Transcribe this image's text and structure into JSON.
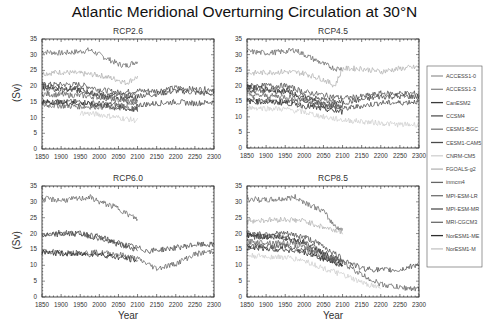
{
  "title": "Atlantic Meridional Overturning Circulation at 30°N",
  "chart_data": {
    "type": "line",
    "title": "Atlantic Meridional Overturning Circulation at 30°N",
    "xlabel": "Year",
    "ylabel": "(Sv)",
    "xlim": [
      1850,
      2300
    ],
    "ylim": [
      0,
      35
    ],
    "xticks": [
      1850,
      1900,
      1950,
      2000,
      2050,
      2100,
      2150,
      2200,
      2250,
      2300
    ],
    "yticks": [
      0,
      5,
      10,
      15,
      20,
      25,
      30,
      35
    ],
    "grid": false,
    "legend_position": "right",
    "legend": [
      "ACCESS1-0",
      "ACCESS1-3",
      "CanESM2",
      "CCSM4",
      "CESM1-BGC",
      "CESM1-CAM5",
      "CNRM-CM5",
      "FGOALS-g2",
      "inmcm4",
      "MPI-ESM-LR",
      "MPI-ESM-MR",
      "MRI-CGCM3",
      "NorESM1-ME",
      "NorESM1-M"
    ],
    "legend_colors": [
      "#9a9a9a",
      "#8a8a8a",
      "#3a3a3a",
      "#555555",
      "#7a7a7a",
      "#4a4a4a",
      "#d0d0d0",
      "#b5b5b5",
      "#666666",
      "#707070",
      "#505050",
      "#6a6a6a",
      "#2e2e2e",
      "#c4c4c4"
    ],
    "panels": [
      {
        "title": "RCP2.6",
        "series": [
          {
            "name": "MPI-ESM-LR",
            "x": [
              1850,
              1900,
              1950,
              1975,
              2000,
              2050,
              2070,
              2100
            ],
            "y": [
              31,
              30.5,
              31,
              31.5,
              30,
              27,
              26.5,
              28
            ]
          },
          {
            "name": "FGOALS-g2",
            "x": [
              1850,
              1900,
              1950,
              2000,
              2050,
              2070,
              2100
            ],
            "y": [
              24,
              24.5,
              24,
              23.5,
              22,
              21,
              23
            ]
          },
          {
            "name": "CCSM4",
            "x": [
              1850,
              1950,
              2000,
              2050,
              2100,
              2150,
              2200,
              2250,
              2300
            ],
            "y": [
              20.5,
              20.5,
              19,
              18,
              18.5,
              18.5,
              19.5,
              19,
              19
            ]
          },
          {
            "name": "CESM1-CAM5",
            "x": [
              1850,
              1950,
              2000,
              2050,
              2100,
              2150,
              2200,
              2250,
              2300
            ],
            "y": [
              19,
              18.5,
              17.5,
              17,
              17,
              17.5,
              18.5,
              18,
              17.5
            ]
          },
          {
            "name": "CanESM2",
            "x": [
              1850,
              1950,
              2000,
              2050,
              2100
            ],
            "y": [
              20,
              19,
              17,
              16,
              16
            ]
          },
          {
            "name": "MRI-CGCM3",
            "x": [
              1850,
              1950,
              2000,
              2050,
              2100
            ],
            "y": [
              17.5,
              17,
              16.5,
              15.5,
              15
            ]
          },
          {
            "name": "MPI-ESM-MR",
            "x": [
              1850,
              1950,
              2000,
              2050,
              2100,
              2150,
              2200,
              2250,
              2300
            ],
            "y": [
              15,
              15,
              14.5,
              14,
              14,
              14.5,
              15,
              14.5,
              15
            ]
          },
          {
            "name": "NorESM1-ME",
            "x": [
              1850,
              1950,
              2000,
              2050,
              2100
            ],
            "y": [
              15,
              14.5,
              14,
              13,
              12.5
            ]
          },
          {
            "name": "inmcm4",
            "x": [
              1850,
              1950,
              2000,
              2050,
              2100
            ],
            "y": [
              14,
              13.5,
              13.5,
              13,
              13
            ]
          },
          {
            "name": "CNRM-CM5",
            "x": [
              1950,
              2000,
              2050,
              2100
            ],
            "y": [
              11.5,
              11,
              10,
              9
            ]
          }
        ]
      },
      {
        "title": "RCP4.5",
        "series": [
          {
            "name": "MPI-ESM-LR",
            "x": [
              1850,
              1900,
              1950,
              1975,
              2000,
              2050,
              2080,
              2100
            ],
            "y": [
              31,
              30.5,
              31,
              31.5,
              30,
              27,
              25.5,
              25.5
            ]
          },
          {
            "name": "FGOALS-g2",
            "x": [
              1850,
              1950,
              2000,
              2050,
              2080,
              2100,
              2150,
              2200,
              2250,
              2300
            ],
            "y": [
              24,
              24.5,
              24,
              22,
              20,
              25.5,
              25.5,
              24.5,
              25.5,
              26
            ]
          },
          {
            "name": "CCSM4",
            "x": [
              1850,
              1950,
              2000,
              2050,
              2100,
              2150,
              2200,
              2250,
              2300
            ],
            "y": [
              20,
              20,
              18,
              17,
              16,
              16.5,
              17.5,
              17.5,
              17.5
            ]
          },
          {
            "name": "CESM1-CAM5",
            "x": [
              1850,
              1950,
              2000,
              2050,
              2100,
              2150,
              2200,
              2250,
              2300
            ],
            "y": [
              18.5,
              18,
              16.5,
              15.5,
              14.5,
              15.5,
              16.5,
              16.5,
              16.5
            ]
          },
          {
            "name": "CanESM2",
            "x": [
              1850,
              1950,
              2000,
              2050,
              2100
            ],
            "y": [
              19.5,
              18.5,
              16,
              14.5,
              13.5
            ]
          },
          {
            "name": "MRI-CGCM3",
            "x": [
              1850,
              1950,
              2000,
              2050,
              2100
            ],
            "y": [
              17,
              16.5,
              15.5,
              14,
              13
            ]
          },
          {
            "name": "MPI-ESM-MR",
            "x": [
              1850,
              1950,
              2000,
              2050,
              2100,
              2150,
              2200,
              2250,
              2300
            ],
            "y": [
              15.5,
              15,
              14.5,
              13.5,
              12.5,
              13.5,
              14.5,
              14.5,
              15
            ]
          },
          {
            "name": "NorESM1-ME",
            "x": [
              1850,
              1950,
              2000,
              2050,
              2100
            ],
            "y": [
              15,
              14.5,
              13.5,
              12.5,
              11.5
            ]
          },
          {
            "name": "CNRM-CM5",
            "x": [
              1850,
              1950,
              2000,
              2050,
              2100,
              2150,
              2200,
              2250,
              2300
            ],
            "y": [
              13,
              12.5,
              11.5,
              10,
              9,
              8.5,
              8,
              7.5,
              7.5
            ]
          }
        ]
      },
      {
        "title": "RCP6.0",
        "series": [
          {
            "name": "MPI-ESM-LR",
            "x": [
              1850,
              1900,
              1950,
              1975,
              2000,
              2050,
              2075,
              2100
            ],
            "y": [
              31,
              30.5,
              31,
              31.5,
              30,
              28,
              26,
              24.5
            ]
          },
          {
            "name": "CCSM4",
            "x": [
              1850,
              1900,
              1950,
              2000,
              2050,
              2100,
              2130,
              2200,
              2250,
              2300
            ],
            "y": [
              19.5,
              20.5,
              20,
              19,
              17,
              15.5,
              14.5,
              15.5,
              16.5,
              16.5
            ]
          },
          {
            "name": "CESM1-CAM5",
            "x": [
              1850,
              1950,
              2000,
              2050,
              2100
            ],
            "y": [
              19.5,
              20,
              18.5,
              16.5,
              15
            ]
          },
          {
            "name": "MRI-CGCM3",
            "x": [
              1850,
              1900,
              1950,
              2000,
              2050,
              2100,
              2150,
              2200,
              2250,
              2300
            ],
            "y": [
              14.5,
              14,
              14,
              14,
              13.5,
              12,
              9,
              10.5,
              13.5,
              14.5
            ]
          },
          {
            "name": "NorESM1-ME",
            "x": [
              1850,
              1950,
              2000,
              2050,
              2100
            ],
            "y": [
              14,
              13.5,
              13.5,
              12.5,
              11.5
            ]
          }
        ]
      },
      {
        "title": "RCP8.5",
        "series": [
          {
            "name": "MPI-ESM-LR",
            "x": [
              1850,
              1900,
              1950,
              1975,
              2000,
              2050,
              2075,
              2100
            ],
            "y": [
              31,
              30.5,
              31,
              31.5,
              30,
              27,
              23,
              21
            ]
          },
          {
            "name": "FGOALS-g2",
            "x": [
              1850,
              1950,
              2000,
              2050,
              2100
            ],
            "y": [
              24,
              24.5,
              24,
              22,
              20.5
            ]
          },
          {
            "name": "CCSM4",
            "x": [
              1850,
              1950,
              2000,
              2050,
              2100,
              2150,
              2200,
              2250,
              2300
            ],
            "y": [
              20,
              20,
              19,
              16,
              12,
              9,
              8.5,
              8.5,
              10.5
            ]
          },
          {
            "name": "CESM1-CAM5",
            "x": [
              1850,
              1950,
              2000,
              2050,
              2100
            ],
            "y": [
              19,
              19,
              17.5,
              14,
              11
            ]
          },
          {
            "name": "CanESM2",
            "x": [
              1850,
              1950,
              2000,
              2050,
              2100
            ],
            "y": [
              19.5,
              18.5,
              17,
              13.5,
              10.5
            ]
          },
          {
            "name": "MRI-CGCM3",
            "x": [
              1850,
              1950,
              2000,
              2050,
              2100,
              2150,
              2200,
              2250,
              2300
            ],
            "y": [
              17.5,
              17,
              16,
              13,
              11,
              7,
              4,
              3,
              2.5
            ]
          },
          {
            "name": "MPI-ESM-MR",
            "x": [
              1850,
              1950,
              2000,
              2050,
              2100
            ],
            "y": [
              16,
              16,
              15,
              12.5,
              10
            ]
          },
          {
            "name": "NorESM1-ME",
            "x": [
              1850,
              1950,
              2000,
              2050,
              2100
            ],
            "y": [
              15.5,
              15,
              14,
              12,
              10
            ]
          },
          {
            "name": "CNRM-CM5",
            "x": [
              1850,
              1950,
              2000,
              2050,
              2100,
              2150,
              2200
            ],
            "y": [
              13,
              12.5,
              11.5,
              9,
              7,
              4.5,
              3
            ]
          }
        ]
      }
    ]
  }
}
